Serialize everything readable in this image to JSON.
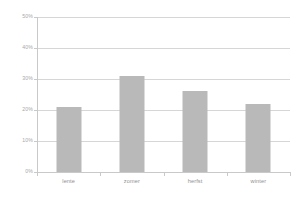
{
  "chart_data": {
    "type": "bar",
    "title": "",
    "subtitle": "",
    "xlabel": "",
    "ylabel": "",
    "categories": [
      "lente",
      "zomer",
      "herfst",
      "winter"
    ],
    "values": [
      21,
      31,
      26,
      22
    ],
    "value_unit": "%",
    "ylim": [
      0,
      50
    ],
    "ytick_values": [
      0,
      10,
      20,
      30,
      40,
      50
    ],
    "ytick_labels": [
      "0%",
      "10%",
      "20%",
      "30%",
      "40%",
      "50%"
    ],
    "grid": true,
    "grid_axis": "y",
    "legend": false,
    "legend_position": "none",
    "series": [
      {
        "name": "",
        "values": [
          21,
          31,
          26,
          22
        ]
      }
    ],
    "colors": {
      "bar_fill": "#b9b9b9",
      "gridline": "#d6d6d6",
      "axis_line": "#c9c9c9",
      "tick_label": "#a8a8a8",
      "category_label": "#8f8f8f",
      "background": "#ffffff"
    }
  }
}
